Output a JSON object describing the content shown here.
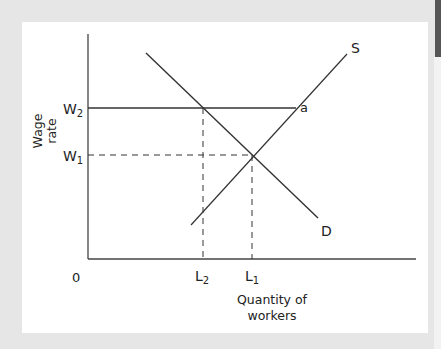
{
  "figure": {
    "y_axis_label_line1": "Wage",
    "y_axis_label_line2": "rate",
    "x_axis_label_line1": "Quantity of",
    "x_axis_label_line2": "workers",
    "origin_label": "0",
    "w2_label": "W",
    "w2_sub": "2",
    "w1_label": "W",
    "w1_sub": "1",
    "l2_label": "L",
    "l2_sub": "2",
    "l1_label": "L",
    "l1_sub": "1",
    "supply_label": "S",
    "demand_label": "D",
    "point_a_label": "a"
  },
  "colors": {
    "background": "#e6e6e6",
    "panel": "#ffffff",
    "line": "#333333"
  }
}
